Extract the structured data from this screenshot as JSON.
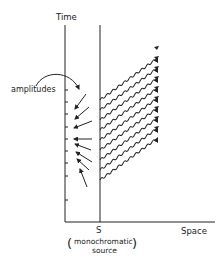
{
  "diagram": {
    "axes": {
      "y_label": "Time",
      "x_label": "Space"
    },
    "source": {
      "marker": "S",
      "description_line1": "monochromatic",
      "description_line2": "source",
      "open_paren": "(",
      "close_paren": ")"
    },
    "annotation": {
      "label": "amplitudes"
    },
    "wave_count": 9,
    "arrow_count": 9,
    "colors": {
      "ink": "#222222",
      "background": "#ffffff"
    }
  }
}
